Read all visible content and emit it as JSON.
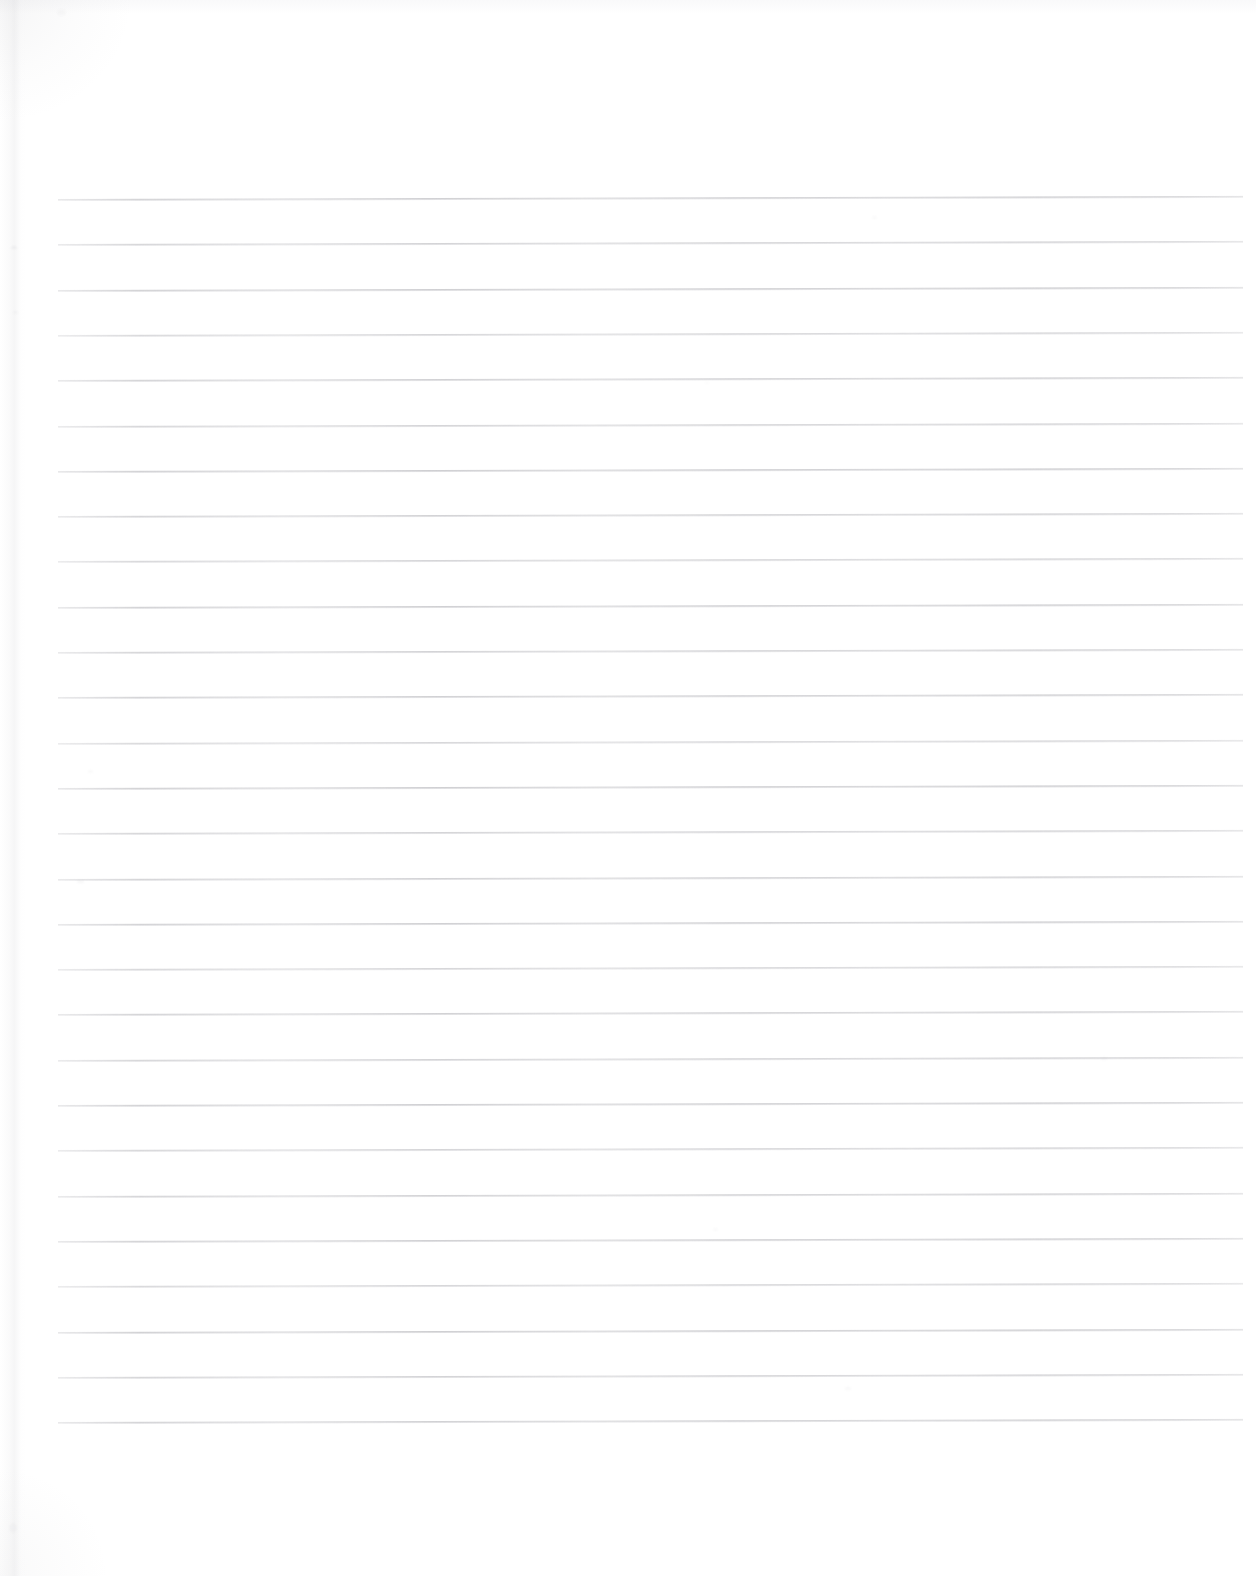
{
  "document": {
    "type": "scanned-lined-paper",
    "title": "Blank ruled notebook page",
    "content_text": "",
    "handwriting_present": "no",
    "printed_text_present": "no",
    "page_number_text": "",
    "background_color": "#ffffff",
    "rule_color": "#8a8a92",
    "paper_edge_color": "#c6c6ca"
  },
  "ruling": {
    "line_count": 28,
    "first_line_y": 199,
    "line_spacing_px": 45.3,
    "line_left_x": 58,
    "line_right_x": 1243,
    "line_width_px": 1185,
    "line_thickness_px": 1,
    "skew_degrees": -0.15,
    "margin_rule_present": "no",
    "header_rule_present": "no"
  },
  "canvas": {
    "width": 1256,
    "height": 1576,
    "top_margin_px": 199,
    "bottom_margin_px": 154,
    "left_margin_px": 58,
    "right_margin_px": 13
  },
  "artifacts": {
    "corner_shading": "top-left, bottom-left",
    "edge_shadow": "right",
    "speck_count": 9
  }
}
